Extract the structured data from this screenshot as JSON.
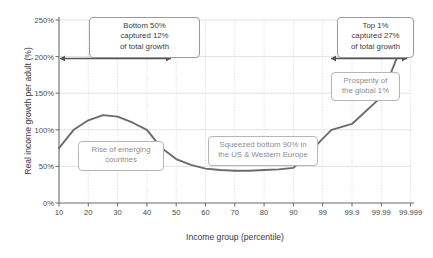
{
  "chart_data": {
    "type": "line",
    "title": "",
    "xlabel": "Income group (percentile)",
    "ylabel": "Real income growth per adult (%)",
    "grid": true,
    "legend": false,
    "line_color": "#6b6b6b",
    "x_tick_labels": [
      "10",
      "20",
      "30",
      "40",
      "50",
      "60",
      "70",
      "80",
      "90",
      "99",
      "99.9",
      "99.99",
      "99.999"
    ],
    "y_tick_labels": [
      "0%",
      "50%",
      "100%",
      "150%",
      "200%",
      "250%"
    ],
    "ylim": [
      0,
      250
    ],
    "y_ticks": [
      0,
      50,
      100,
      150,
      200,
      250
    ],
    "x": [
      "10",
      "15",
      "20",
      "25",
      "30",
      "35",
      "40",
      "45",
      "50",
      "55",
      "60",
      "65",
      "70",
      "75",
      "80",
      "85",
      "90",
      "95",
      "99",
      "99.5",
      "99.9",
      "99.99",
      "99.999"
    ],
    "values": [
      75,
      100,
      113,
      120,
      118,
      110,
      100,
      75,
      60,
      52,
      47,
      45,
      44,
      44,
      45,
      46,
      48,
      58,
      88,
      100,
      108,
      145,
      245
    ],
    "annotations": [
      {
        "name": "bottom-50-callout",
        "lines": [
          "Bottom 50%",
          "captured 12%",
          "of total growth"
        ],
        "style": "solid"
      },
      {
        "name": "top-1-callout",
        "lines": [
          "Top 1%",
          "captured 27%",
          "of total growth"
        ],
        "style": "solid"
      },
      {
        "name": "rise-of-emerging-countries-callout",
        "lines": [
          "Rise of emerging",
          "countries"
        ],
        "style": "muted"
      },
      {
        "name": "squeezed-bottom-90-callout",
        "lines": [
          "Squeezed bottom 90% in",
          "the US & Western Europe"
        ],
        "style": "muted"
      },
      {
        "name": "prosperity-global-1-callout",
        "lines": [
          "Prosperity of",
          "the global 1%"
        ],
        "style": "muted"
      }
    ]
  }
}
